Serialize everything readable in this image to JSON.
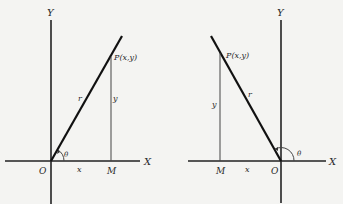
{
  "figures": [
    {
      "id": "first-quadrant",
      "labels": {
        "y_axis": "Y",
        "x_axis": "X",
        "origin": "O",
        "foot": "M",
        "point": "P(x,y)",
        "radius": "r",
        "ordinate": "y",
        "abscissa": "x",
        "angle": "θ"
      }
    },
    {
      "id": "second-quadrant",
      "labels": {
        "y_axis": "Y",
        "x_axis": "X",
        "origin": "O",
        "foot": "M",
        "point": "P(x,y)",
        "radius": "r",
        "ordinate": "y",
        "abscissa": "x",
        "angle": "θ"
      }
    }
  ]
}
